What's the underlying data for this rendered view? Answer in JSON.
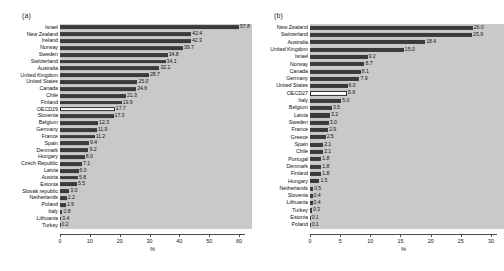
{
  "figure": {
    "background": "#ffffff",
    "plot_background": "#c9c9c9",
    "bar_color": "#3a3a3a",
    "highlight_bar_color": "#ffffff"
  },
  "panels": {
    "a": {
      "tag": "(a)",
      "axis_title": "%"
    },
    "b": {
      "tag": "(b)",
      "axis_title": "%"
    }
  },
  "chart_data": [
    {
      "type": "bar",
      "title": "(a)",
      "orientation": "horizontal",
      "xlabel": "%",
      "ylabel": "",
      "xlim": [
        0,
        62
      ],
      "xticks": [
        0,
        10,
        20,
        30,
        40,
        50,
        60
      ],
      "xticklabels": [
        "0",
        "10",
        "20",
        "30",
        "40",
        "50",
        "60"
      ],
      "grid": false,
      "legend": "none",
      "highlight_category": "OECD29",
      "categories": [
        "Israel",
        "New Zealand",
        "Ireland",
        "Norway",
        "Sweden",
        "Switzerland",
        "Australia",
        "United Kingdom",
        "United States",
        "Canada",
        "Chile",
        "Finland",
        "OECD29",
        "Slovenia",
        "Belgium",
        "Germany",
        "France",
        "Spain",
        "Denmark",
        "Hungary",
        "Czech Republic",
        "Latvia",
        "Austria",
        "Estonia",
        "Slovak republic",
        "Netherlands",
        "Poland",
        "Italy",
        "Lithuania",
        "Turkey"
      ],
      "values": [
        57.8,
        42.4,
        42.3,
        39.7,
        34.8,
        34.1,
        32.1,
        28.7,
        25.0,
        24.6,
        21.3,
        19.9,
        17.7,
        17.3,
        12.3,
        11.9,
        11.2,
        9.4,
        9.2,
        8.0,
        7.1,
        6.0,
        5.8,
        5.5,
        3.0,
        2.2,
        1.9,
        0.8,
        0.4,
        0.2
      ],
      "datalabels": [
        "57.8",
        "42.4",
        "42.3",
        "39.7",
        "34.8",
        "34.1",
        "32.1",
        "28.7",
        "25.0",
        "24.6",
        "21.3",
        "19.9",
        "17.7",
        "17.3",
        "12.3",
        "11.9",
        "11.2",
        "9.4",
        "9.2",
        "8.0",
        "7.1",
        "6.0",
        "5.8",
        "5.5",
        "3.0",
        "2.2",
        "1.9",
        "0.8",
        "0.4",
        "0.2"
      ]
    },
    {
      "type": "bar",
      "title": "(b)",
      "orientation": "horizontal",
      "xlabel": "%",
      "ylabel": "",
      "xlim": [
        0,
        31
      ],
      "xticks": [
        0,
        5,
        10,
        15,
        20,
        25,
        30
      ],
      "xticklabels": [
        "0",
        "5",
        "10",
        "15",
        "20",
        "25",
        "30"
      ],
      "grid": false,
      "legend": "none",
      "highlight_category": "OECD27",
      "categories": [
        "New Zealand",
        "Switzerland",
        "Australia",
        "United Kingdom",
        "Israel",
        "Norway",
        "Canada",
        "Germany",
        "United States",
        "OECD27",
        "Italy",
        "Belgium",
        "Latvia",
        "Sweden",
        "France",
        "Greece",
        "Spain",
        "Chile",
        "Portugal",
        "Denmark",
        "Finland",
        "Hungary",
        "Netherlands",
        "Slovenia",
        "Lithuania",
        "Turkey",
        "Estonia",
        "Poland"
      ],
      "values": [
        26.0,
        25.9,
        18.4,
        15.0,
        9.2,
        8.7,
        8.1,
        7.9,
        6.0,
        5.9,
        5.0,
        3.5,
        3.2,
        3.0,
        2.9,
        2.5,
        2.1,
        2.1,
        1.8,
        1.8,
        1.8,
        1.5,
        0.5,
        0.4,
        0.4,
        0.3,
        0.1,
        0.1
      ],
      "datalabels": [
        "26.0",
        "25.9",
        "18.4",
        "15.0",
        "9.2",
        "8.7",
        "8.1",
        "7.9",
        "6.0",
        "5.9",
        "5.0",
        "3.5",
        "3.2",
        "3.0",
        "2.9",
        "2.5",
        "2.1",
        "2.1",
        "1.8",
        "1.8",
        "1.8",
        "1.5",
        "0.5",
        "0.4",
        "0.4",
        "0.3",
        "0.1",
        "0.1"
      ]
    }
  ]
}
